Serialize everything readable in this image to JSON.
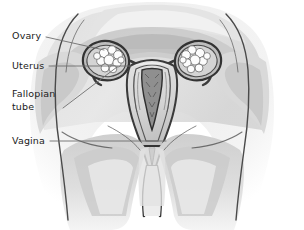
{
  "figure": {
    "view": "coronal front view",
    "style": "grayscale pencil and wash medical illustration",
    "width": 304,
    "height": 230,
    "background_color": "#ffffff"
  },
  "labels": [
    {
      "id": "ovary",
      "text": "Ovary",
      "lines": [
        "Ovary"
      ],
      "text_x": 12,
      "text_y": 30,
      "leader": {
        "x1": 46,
        "y1": 37,
        "x2": 104,
        "y2": 50
      }
    },
    {
      "id": "uterus",
      "text": "Uterus",
      "lines": [
        "Uterus"
      ],
      "text_x": 12,
      "text_y": 60,
      "leader": {
        "x1": 49,
        "y1": 66,
        "x2": 131,
        "y2": 66
      }
    },
    {
      "id": "fallopian-tube",
      "text": "Fallopian tube",
      "lines": [
        "Fallopian",
        "tube"
      ],
      "text_x": 12,
      "text_y": 88,
      "leader": {
        "x1": 63,
        "y1": 108,
        "x2": 117,
        "y2": 67
      }
    },
    {
      "id": "vagina",
      "text": "Vagina",
      "lines": [
        "Vagina"
      ],
      "text_x": 12,
      "text_y": 135,
      "leader": {
        "x1": 50,
        "y1": 141,
        "x2": 166,
        "y2": 141
      }
    }
  ],
  "anatomy": {
    "parts": [
      {
        "id": "left-ovary",
        "name": "Left ovary",
        "appearance": "white lobed cluster in dark pocket"
      },
      {
        "id": "right-ovary",
        "name": "Right ovary",
        "appearance": "white lobed cluster in dark pocket"
      },
      {
        "id": "left-fallopian-tube",
        "name": "Left fallopian tube",
        "appearance": "dark curved tube to uterus"
      },
      {
        "id": "right-fallopian-tube",
        "name": "Right fallopian tube",
        "appearance": "dark curved tube to uterus"
      },
      {
        "id": "uterus-body",
        "name": "Uterus",
        "appearance": "pear shaped central organ"
      },
      {
        "id": "uterine-cavity",
        "name": "Uterine cavity",
        "appearance": "dark triangular inner cavity"
      },
      {
        "id": "cervix",
        "name": "Cervix",
        "appearance": "narrow neck below uterus"
      },
      {
        "id": "vaginal-canal",
        "name": "Vagina",
        "appearance": "dark canal descending to outlet"
      },
      {
        "id": "pelvic-tissue",
        "name": "Surrounding pelvic tissue",
        "appearance": "soft gray wash shapes"
      },
      {
        "id": "thigh-left",
        "name": "Left thigh",
        "appearance": "large pale mass lower left"
      },
      {
        "id": "thigh-right",
        "name": "Right thigh",
        "appearance": "large pale mass lower right"
      }
    ],
    "palette": {
      "ink": "#3a3a3a",
      "ink_dark": "#222222",
      "wash_light": "#eeeeee",
      "wash_mid": "#d6d6d6",
      "wash_dark": "#b6b6b6",
      "wash_deep": "#9a9a9a",
      "highlight": "#fbfbfb",
      "leader_line": "#6e6e6e",
      "text": "#1b1b1b"
    }
  }
}
